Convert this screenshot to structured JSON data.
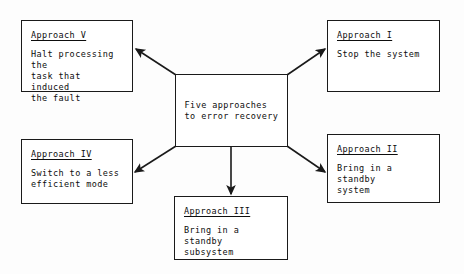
{
  "diagram": {
    "title": "Five approaches to error recovery",
    "center": {
      "name": "center-node",
      "text": "Five approaches\nto error recovery",
      "x": 175,
      "y": 74,
      "w": 113,
      "h": 73
    },
    "colors": {
      "background": "#fdfdfd",
      "box_fill": "#ffffff",
      "line": "#1a1a1a",
      "text": "#0d0d0d"
    },
    "nodes": [
      {
        "id": "approach-v",
        "title": "Approach V",
        "body": "Halt processing the\ntask that induced\nthe fault",
        "x": 21,
        "y": 20,
        "w": 112,
        "h": 72
      },
      {
        "id": "approach-i",
        "title": "Approach I",
        "body": "Stop the system",
        "x": 327,
        "y": 20,
        "w": 113,
        "h": 72
      },
      {
        "id": "approach-iv",
        "title": "Approach IV",
        "body": "Switch to a less\nefficient mode",
        "x": 21,
        "y": 139,
        "w": 112,
        "h": 65
      },
      {
        "id": "approach-ii",
        "title": "Approach II",
        "body": "Bring in a standby\nsystem",
        "x": 327,
        "y": 134,
        "w": 113,
        "h": 69
      },
      {
        "id": "approach-iii",
        "title": "Approach III",
        "body": "Bring in a standby\nsubsystem",
        "x": 174,
        "y": 196,
        "w": 114,
        "h": 64
      }
    ],
    "arrows": [
      {
        "id": "arrow-to-approach-v",
        "x1": 176,
        "y1": 75,
        "x2": 136,
        "y2": 49
      },
      {
        "id": "arrow-to-approach-i",
        "x1": 287,
        "y1": 75,
        "x2": 325,
        "y2": 49
      },
      {
        "id": "arrow-to-approach-iv",
        "x1": 176,
        "y1": 146,
        "x2": 135,
        "y2": 172
      },
      {
        "id": "arrow-to-approach-ii",
        "x1": 287,
        "y1": 146,
        "x2": 325,
        "y2": 172
      },
      {
        "id": "arrow-to-approach-iii",
        "x1": 231,
        "y1": 147,
        "x2": 231,
        "y2": 194
      }
    ]
  }
}
